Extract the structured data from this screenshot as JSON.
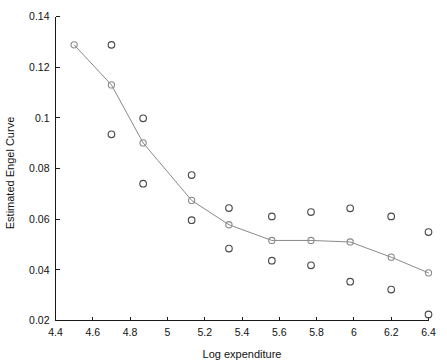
{
  "chart_data": {
    "type": "scatter",
    "title": "",
    "xlabel": "Log expenditure",
    "ylabel": "Estimated Engel Curve",
    "xlim": [
      4.4,
      6.4
    ],
    "ylim": [
      0.02,
      0.14
    ],
    "grid": false,
    "legend": null,
    "xticks": [
      "4.4",
      "4.6",
      "4.8",
      "5",
      "5.2",
      "5.4",
      "5.6",
      "5.8",
      "6",
      "6.2",
      "6.4"
    ],
    "xtick_values": [
      4.4,
      4.6,
      4.8,
      5.0,
      5.2,
      5.4,
      5.6,
      5.8,
      6.0,
      6.2,
      6.4
    ],
    "yticks": [
      "0.02",
      "0.04",
      "0.06",
      "0.08",
      "0.1",
      "0.12",
      "0.14"
    ],
    "ytick_values": [
      0.02,
      0.04,
      0.06,
      0.08,
      0.1,
      0.12,
      0.14
    ],
    "series": [
      {
        "name": "Estimated Engel Curve",
        "style": "line-with-markers",
        "color": "#8a8a8a",
        "marker": "circle-open",
        "x": [
          4.5,
          4.7,
          4.87,
          5.13,
          5.33,
          5.56,
          5.77,
          5.98,
          6.2,
          6.4
        ],
        "values": [
          0.1288,
          0.113,
          0.0901,
          0.0674,
          0.0578,
          0.0516,
          0.0516,
          0.051,
          0.045,
          0.0388
        ]
      },
      {
        "name": "Observed points",
        "style": "markers",
        "color": "#4a4a4a",
        "marker": "circle-open",
        "x": [
          4.7,
          4.7,
          4.87,
          4.87,
          5.13,
          5.13,
          5.33,
          5.33,
          5.56,
          5.56,
          5.77,
          5.77,
          5.98,
          5.98,
          6.2,
          6.2,
          6.4,
          6.4
        ],
        "values": [
          0.1288,
          0.0935,
          0.0998,
          0.074,
          0.0774,
          0.0596,
          0.0644,
          0.0484,
          0.0611,
          0.0436,
          0.0628,
          0.0418,
          0.0643,
          0.0353,
          0.0611,
          0.0322,
          0.0549,
          0.0224
        ]
      }
    ]
  },
  "axes": {
    "x_label": "Log expenditure",
    "y_label": "Estimated Engel Curve"
  }
}
